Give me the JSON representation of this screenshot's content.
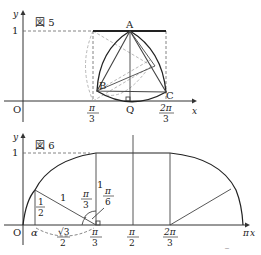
{
  "figure5": {
    "title": "図 5",
    "axis_y": "y",
    "axis_x": "x",
    "origin": "O",
    "y_tick_1": "1",
    "points": {
      "A": "A",
      "B": "B",
      "C": "C",
      "Q": "Q"
    },
    "x_ticks": {
      "pi_over_3": {
        "num": "π",
        "den": "3"
      },
      "two_pi_over_3": {
        "num": "2π",
        "den": "3"
      }
    }
  },
  "figure6": {
    "title": "図 6",
    "axis_y": "y",
    "axis_x": "x",
    "origin": "O",
    "y_tick_1": "1",
    "alpha": "α",
    "x_ticks": {
      "pi_over_3": {
        "num": "π",
        "den": "3"
      },
      "pi_over_2": {
        "num": "π",
        "den": "2"
      },
      "two_pi_over_3": {
        "num": "2π",
        "den": "3"
      },
      "pi": "π"
    },
    "labels": {
      "half": {
        "num": "1",
        "den": "2"
      },
      "one_slant": "1",
      "one_vertical": "1",
      "angle_pi3": {
        "num": "π",
        "den": "3"
      },
      "angle_pi6": {
        "num": "π",
        "den": "6"
      },
      "sqrt3_over_2": {
        "num": "√3",
        "den": "2"
      }
    }
  },
  "footer_partial_glyph": "‾"
}
